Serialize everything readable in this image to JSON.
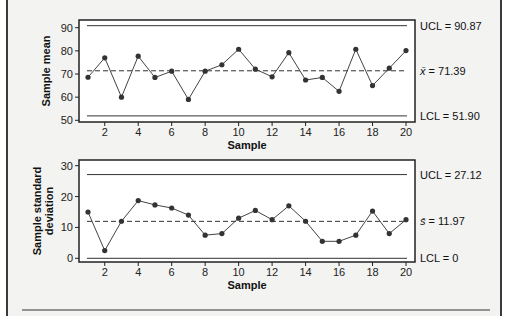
{
  "chart_data": [
    {
      "type": "line",
      "title": "",
      "xlabel": "Sample",
      "ylabel": "Sample mean",
      "x": [
        1,
        2,
        3,
        4,
        5,
        6,
        7,
        8,
        9,
        10,
        11,
        12,
        13,
        14,
        15,
        16,
        17,
        18,
        19,
        20
      ],
      "values": [
        68.6,
        77.0,
        60.0,
        77.7,
        68.5,
        71.2,
        59.0,
        71.2,
        74.0,
        80.7,
        72.1,
        68.8,
        79.2,
        67.4,
        68.5,
        62.5,
        80.7,
        65.0,
        72.5,
        80.1
      ],
      "ylim": [
        50,
        90
      ],
      "yticks": [
        50,
        60,
        70,
        80,
        90
      ],
      "xticks": [
        2,
        4,
        6,
        8,
        10,
        12,
        14,
        16,
        18,
        20
      ],
      "reference_lines": {
        "ucl": {
          "value": 90.87,
          "label": "UCL = 90.87",
          "style": "solid"
        },
        "center": {
          "value": 71.39,
          "label_symbol": "x̄",
          "label_value": " = 71.39",
          "style": "dashed"
        },
        "lcl": {
          "value": 51.9,
          "label": "LCL = 51.90",
          "style": "solid"
        }
      },
      "grid": false
    },
    {
      "type": "line",
      "title": "",
      "xlabel": "Sample",
      "ylabel_line1": "Sample standard",
      "ylabel_line2": "deviation",
      "x": [
        1,
        2,
        3,
        4,
        5,
        6,
        7,
        8,
        9,
        10,
        11,
        12,
        13,
        14,
        15,
        16,
        17,
        18,
        19,
        20
      ],
      "values": [
        15.0,
        2.5,
        12.0,
        18.7,
        17.3,
        16.3,
        14.0,
        7.5,
        8.0,
        13.0,
        15.5,
        12.5,
        17.0,
        12.0,
        5.5,
        5.5,
        7.5,
        15.3,
        8.0,
        12.5
      ],
      "ylim": [
        0,
        30
      ],
      "yticks": [
        0,
        10,
        20,
        30
      ],
      "xticks": [
        2,
        4,
        6,
        8,
        10,
        12,
        14,
        16,
        18,
        20
      ],
      "reference_lines": {
        "ucl": {
          "value": 27.12,
          "label": "UCL = 27.12",
          "style": "solid"
        },
        "center": {
          "value": 11.97,
          "label_symbol": "s̄",
          "label_value": " = 11.97",
          "style": "dashed"
        },
        "lcl": {
          "value": 0,
          "label": "LCL = 0",
          "style": "solid"
        }
      },
      "grid": false
    }
  ],
  "colors": {
    "background": "#f3f3f1",
    "plot_bg": "#ffffff",
    "line": "#3a3a3a",
    "marker": "#3a3a3a"
  }
}
